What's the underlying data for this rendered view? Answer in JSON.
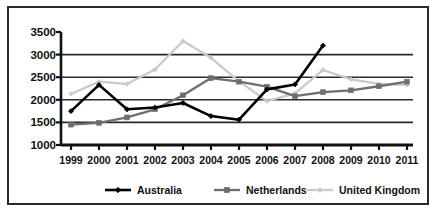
{
  "chart_data": {
    "type": "line",
    "title": "",
    "subtitle": "",
    "xlabel": "",
    "ylabel": "",
    "grid": true,
    "legend_position": "bottom",
    "categories": [
      "1999",
      "2000",
      "2001",
      "2002",
      "2003",
      "2004",
      "2005",
      "2006",
      "2007",
      "2008",
      "2009",
      "2010",
      "2011"
    ],
    "x": [
      1999,
      2000,
      2001,
      2002,
      2003,
      2004,
      2005,
      2006,
      2007,
      2008,
      2009,
      2010,
      2011
    ],
    "ylim": [
      1000,
      3500
    ],
    "xlim": [
      1999,
      2011
    ],
    "yticks": [
      1000,
      1500,
      2000,
      2500,
      3000,
      3500
    ],
    "ytick_labels": [
      "1000",
      "1500",
      "2000",
      "2500",
      "3000",
      "3500"
    ],
    "series": [
      {
        "name": "Australia",
        "color": "#000000",
        "marker": "diamond",
        "values": [
          1750,
          2330,
          1790,
          1830,
          1930,
          1640,
          1560,
          2230,
          2340,
          3200,
          null,
          null,
          null
        ]
      },
      {
        "name": "Netherlands",
        "color": "#6e6e6e",
        "marker": "square",
        "values": [
          1450,
          1490,
          1610,
          1790,
          2100,
          2480,
          2400,
          2290,
          2080,
          2170,
          2210,
          2300,
          2400
        ]
      },
      {
        "name": "United Kingdom",
        "color": "#cacaca",
        "marker": "diamond",
        "values": [
          2130,
          2400,
          2350,
          2670,
          3300,
          2930,
          2410,
          1970,
          2140,
          2660,
          2450,
          2350,
          2330
        ]
      }
    ]
  },
  "axis": {
    "y_tick_labels": [
      "3500",
      "3000",
      "2500",
      "2000",
      "1500",
      "1000"
    ],
    "x_tick_labels": [
      "1999",
      "2000",
      "2001",
      "2002",
      "2003",
      "2004",
      "2005",
      "2006",
      "2007",
      "2008",
      "2009",
      "2010",
      "2011"
    ]
  },
  "legend": {
    "items": [
      {
        "label": "Australia",
        "color": "#000000",
        "marker": "diamond"
      },
      {
        "label": "Netherlands",
        "color": "#6e6e6e",
        "marker": "square"
      },
      {
        "label": "United Kingdom",
        "color": "#cacaca",
        "marker": "diamond"
      }
    ]
  },
  "colors": {
    "frame": "#2b2b2b",
    "axis": "#111111",
    "gridline": "#2b2b2b",
    "background": "#ffffff",
    "australia": "#000000",
    "netherlands": "#6e6e6e",
    "united_kingdom": "#cacaca"
  }
}
